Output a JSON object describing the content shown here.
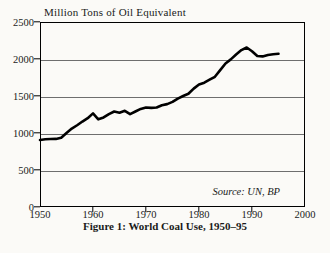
{
  "chart_data": {
    "type": "line",
    "title": "",
    "caption": "Figure 1: World Coal Use, 1950–95",
    "ylabel": "Million Tons of Oil Equivalent",
    "xlabel": "",
    "source": "Source: UN, BP",
    "xlim": [
      1950,
      2000
    ],
    "ylim": [
      0,
      2500
    ],
    "yticks": [
      0,
      500,
      1000,
      1500,
      2000,
      2500
    ],
    "xticks": [
      1950,
      1960,
      1970,
      1980,
      1990,
      2000
    ],
    "grid": "horizontal",
    "legend": "none",
    "line_color": "#000000",
    "background_color": "#fbfaf7",
    "series": [
      {
        "name": "World Coal Use",
        "x": [
          1950,
          1951,
          1952,
          1953,
          1954,
          1955,
          1956,
          1957,
          1958,
          1959,
          1960,
          1961,
          1962,
          1963,
          1964,
          1965,
          1966,
          1967,
          1968,
          1969,
          1970,
          1971,
          1972,
          1973,
          1974,
          1975,
          1976,
          1977,
          1978,
          1979,
          1980,
          1981,
          1982,
          1983,
          1984,
          1985,
          1986,
          1987,
          1988,
          1989,
          1990,
          1991,
          1992,
          1993,
          1994,
          1995
        ],
        "values": [
          905,
          915,
          918,
          920,
          935,
          1000,
          1060,
          1105,
          1155,
          1200,
          1265,
          1185,
          1210,
          1255,
          1290,
          1275,
          1300,
          1255,
          1290,
          1325,
          1345,
          1340,
          1345,
          1375,
          1390,
          1420,
          1465,
          1500,
          1530,
          1600,
          1655,
          1680,
          1720,
          1760,
          1850,
          1940,
          1995,
          2060,
          2120,
          2155,
          2105,
          2040,
          2035,
          2055,
          2065,
          2070
        ]
      }
    ]
  }
}
